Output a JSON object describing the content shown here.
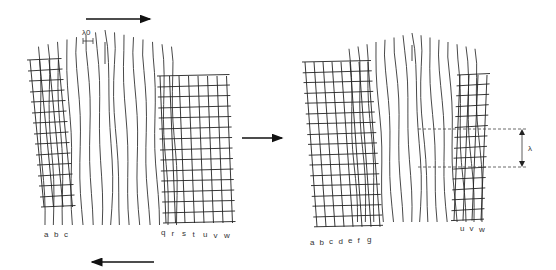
{
  "figure": {
    "left_panel": {
      "top_arrow_direction": "right",
      "bottom_arrow_direction": "left",
      "wavelength_label": "λ0",
      "left_grid_labels": [
        "a",
        "b",
        "c"
      ],
      "right_grid_labels": [
        "q",
        "r",
        "s",
        "t",
        "u",
        "v",
        "w"
      ]
    },
    "transition_arrow_direction": "right",
    "right_panel": {
      "wavelength_label": "λ",
      "left_grid_labels": [
        "a",
        "b",
        "c",
        "d",
        "e",
        "f",
        "g"
      ],
      "right_grid_labels": [
        "u",
        "v",
        "w"
      ]
    }
  }
}
